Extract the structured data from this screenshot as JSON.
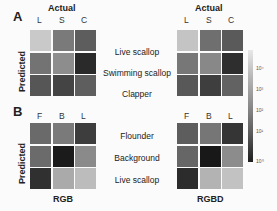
{
  "panels": {
    "A": {
      "letter": "A",
      "x_title": "Actual",
      "y_title": "Predicted",
      "columns": [
        "L",
        "S",
        "C"
      ],
      "rows": [
        "Live scallop",
        "Swimming scallop",
        "Clapper"
      ],
      "rgb_colors": [
        [
          "#c9c9c9",
          "#7a7a7a",
          "#5d5d5d"
        ],
        [
          "#737373",
          "#8d8d8d",
          "#2a2a2a"
        ],
        [
          "#565656",
          "#444444",
          "#5e5e5e"
        ]
      ],
      "rgbd_colors": [
        [
          "#c4c4c4",
          "#6f6f6f",
          "#5a5a5a"
        ],
        [
          "#777777",
          "#888888",
          "#2e2e2e"
        ],
        [
          "#585858",
          "#3e3e3e",
          "#626262"
        ]
      ]
    },
    "B": {
      "letter": "B",
      "y_title": "Predicted",
      "columns": [
        "F",
        "B",
        "L"
      ],
      "rows": [
        "Flounder",
        "Background",
        "Live scallop"
      ],
      "rgb_colors": [
        [
          "#6a6a6a",
          "#7a7a7a",
          "#3d3d3d"
        ],
        [
          "#6b6b6b",
          "#1b1b1b",
          "#8a8a8a"
        ],
        [
          "#303030",
          "#aaaaaa",
          "#bcbcbc"
        ]
      ],
      "rgbd_colors": [
        [
          "#5d5d5d",
          "#767676",
          "#353535"
        ],
        [
          "#666666",
          "#181818",
          "#8c8c8c"
        ],
        [
          "#2c2c2c",
          "#b3b3b3",
          "#c2c2c2"
        ]
      ],
      "left_caption": "RGB",
      "right_caption": "RGBD"
    }
  },
  "colorbar": {
    "ticks": [
      "10⁴",
      "10³",
      "10²",
      "10¹",
      "10⁰"
    ],
    "scale": "log"
  },
  "chart_data": [
    {
      "type": "heatmap",
      "title": "A (RGB)",
      "xlabel": "Actual",
      "ylabel": "Predicted",
      "x": [
        "L",
        "S",
        "C"
      ],
      "y": [
        "Live scallop",
        "Swimming scallop",
        "Clapper"
      ],
      "values_log10_approx": [
        [
          3.3,
          1.8,
          1.2
        ],
        [
          1.6,
          2.2,
          0.4
        ],
        [
          1.1,
          0.8,
          1.2
        ]
      ],
      "colorbar": {
        "scale": "log",
        "range": [
          1,
          10000
        ],
        "ticks": [
          "10⁰",
          "10¹",
          "10²",
          "10³",
          "10⁴"
        ]
      }
    },
    {
      "type": "heatmap",
      "title": "A (RGBD)",
      "xlabel": "Actual",
      "ylabel": "Predicted",
      "x": [
        "L",
        "S",
        "C"
      ],
      "y": [
        "Live scallop",
        "Swimming scallop",
        "Clapper"
      ],
      "values_log10_approx": [
        [
          3.2,
          1.5,
          1.1
        ],
        [
          1.7,
          2.1,
          0.5
        ],
        [
          1.1,
          0.7,
          1.3
        ]
      ]
    },
    {
      "type": "heatmap",
      "title": "B (RGB)",
      "ylabel": "Predicted",
      "xlabel": "RGB",
      "x": [
        "F",
        "B",
        "L"
      ],
      "y": [
        "Flounder",
        "Background",
        "Live scallop"
      ],
      "values_log10_approx": [
        [
          1.4,
          1.8,
          0.8
        ],
        [
          1.4,
          0.2,
          2.2
        ],
        [
          0.5,
          2.9,
          3.2
        ]
      ]
    },
    {
      "type": "heatmap",
      "title": "B (RGBD)",
      "ylabel": "Predicted",
      "xlabel": "RGBD",
      "x": [
        "F",
        "B",
        "L"
      ],
      "y": [
        "Flounder",
        "Background",
        "Live scallop"
      ],
      "values_log10_approx": [
        [
          1.2,
          1.7,
          0.6
        ],
        [
          1.3,
          0.1,
          2.2
        ],
        [
          0.4,
          3.0,
          3.3
        ]
      ]
    }
  ]
}
